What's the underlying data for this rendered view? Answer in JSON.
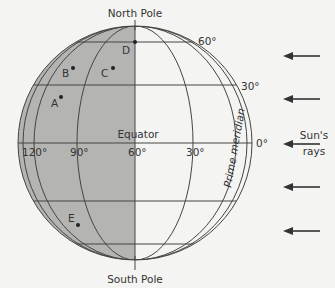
{
  "diagram": {
    "type": "globe-illumination",
    "labels": {
      "north_pole": "North Pole",
      "south_pole": "South Pole",
      "equator": "Equator",
      "prime_meridian": "Prime meridian",
      "suns_rays_line1": "Sun's",
      "suns_rays_line2": "rays"
    },
    "latitude_labels": {
      "lat60": "60°",
      "lat30": "30°",
      "lat0": "0°"
    },
    "longitude_labels": {
      "lon120": "120°",
      "lon90": "90°",
      "lon60": "60°",
      "lon30": "30°"
    },
    "points": [
      {
        "id": "A",
        "label": "A"
      },
      {
        "id": "B",
        "label": "B"
      },
      {
        "id": "C",
        "label": "C"
      },
      {
        "id": "D",
        "label": "D"
      },
      {
        "id": "E",
        "label": "E"
      }
    ],
    "colors": {
      "night_shade": "#b4b4b2",
      "line": "#444444",
      "background": "#f4f4f2"
    }
  }
}
